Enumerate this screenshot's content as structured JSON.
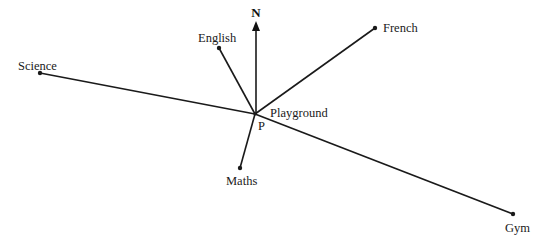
{
  "diagram": {
    "north_label": "N",
    "center": {
      "label": "Playground",
      "point_label": "P",
      "x": 255,
      "y": 114
    },
    "locations": [
      {
        "name": "English",
        "x": 219,
        "y": 48
      },
      {
        "name": "French",
        "x": 375,
        "y": 28
      },
      {
        "name": "Science",
        "x": 40,
        "y": 73
      },
      {
        "name": "Maths",
        "x": 240,
        "y": 168
      },
      {
        "name": "Gym",
        "x": 513,
        "y": 214
      }
    ],
    "line_color": "#1a1a1a"
  }
}
